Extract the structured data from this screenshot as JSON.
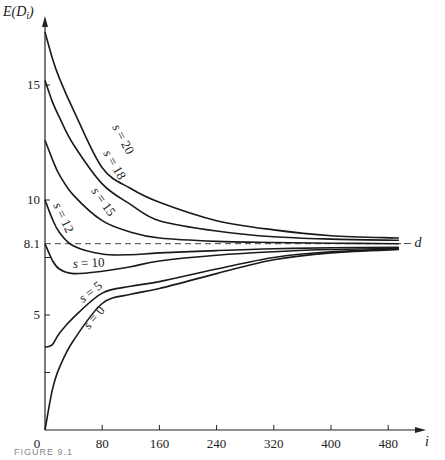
{
  "chart_data": {
    "type": "line",
    "title": "",
    "xlabel": "i",
    "ylabel": "E(D_i)",
    "xlim": [
      0,
      500
    ],
    "ylim": [
      0,
      17.5
    ],
    "x_ticks": [
      0,
      80,
      160,
      240,
      320,
      400,
      480
    ],
    "y_ticks": [
      2.5,
      5,
      7.5,
      10,
      15
    ],
    "y_tick_labels": [
      {
        "value": 5,
        "label": "5"
      },
      {
        "value": 8.1,
        "label": "8.1"
      },
      {
        "value": 10,
        "label": "10"
      },
      {
        "value": 15,
        "label": "15"
      }
    ],
    "grid": false,
    "legend": "none (inline curve labels)",
    "reference_line": {
      "value": 8.1,
      "style": "dashed",
      "label": "d"
    },
    "x": [
      0,
      10,
      20,
      40,
      80,
      120,
      160,
      240,
      320,
      400,
      495
    ],
    "series": [
      {
        "name": "s = 20",
        "values": [
          17.3,
          16.2,
          15.3,
          13.9,
          11.4,
          10.5,
          9.9,
          9.1,
          8.7,
          8.45,
          8.35
        ]
      },
      {
        "name": "s = 18",
        "values": [
          15.2,
          14.3,
          13.6,
          12.4,
          10.7,
          9.8,
          9.1,
          8.65,
          8.4,
          8.3,
          8.25
        ]
      },
      {
        "name": "s = 15",
        "values": [
          12.6,
          11.8,
          11.1,
          10.2,
          9.1,
          8.6,
          8.35,
          8.2,
          8.15,
          8.12,
          8.1
        ]
      },
      {
        "name": "s = 12",
        "values": [
          10.0,
          9.2,
          8.6,
          8.0,
          7.65,
          7.62,
          7.7,
          7.8,
          7.88,
          7.92,
          7.95
        ]
      },
      {
        "name": "s = 10",
        "values": [
          8.1,
          7.4,
          7.0,
          6.8,
          6.9,
          7.1,
          7.35,
          7.6,
          7.75,
          7.85,
          7.9
        ]
      },
      {
        "name": "s = 5",
        "values": [
          3.6,
          3.7,
          4.2,
          4.9,
          5.95,
          6.25,
          6.45,
          7.0,
          7.5,
          7.75,
          7.87
        ]
      },
      {
        "name": "s = 0",
        "values": [
          0.0,
          1.7,
          2.7,
          3.9,
          5.5,
          5.9,
          6.15,
          6.8,
          7.4,
          7.7,
          7.85
        ]
      }
    ],
    "annotations": [
      "s = 20",
      "s = 18",
      "s = 15",
      "s = 12",
      "s = 10",
      "s = 5",
      "s = 0",
      "d",
      "8.1"
    ]
  },
  "labels": {
    "y_axis": "E(D",
    "y_axis_sub": "i",
    "y_axis_close": ")",
    "x_axis": "i",
    "ref_line": "– d",
    "origin": "0",
    "caption": "FIGURE 9.1"
  },
  "curve_labels": [
    {
      "s": "s",
      "eq": " = 20"
    },
    {
      "s": "s",
      "eq": " = 18"
    },
    {
      "s": "s",
      "eq": " = 15"
    },
    {
      "s": "s",
      "eq": " = 12"
    },
    {
      "s": "s",
      "eq": " = 10"
    },
    {
      "s": "s",
      "eq": " = 5"
    },
    {
      "s": "s",
      "eq": " = 0"
    }
  ]
}
